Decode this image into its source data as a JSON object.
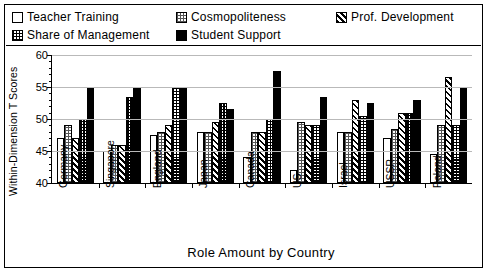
{
  "chart_data": {
    "type": "bar",
    "title": "",
    "xlabel": "Role Amount by Country",
    "ylabel": "Within-Dimension T Scores",
    "ylim": [
      40,
      60
    ],
    "yticks": [
      40,
      45,
      50,
      55,
      60
    ],
    "ytick_labels": [
      "40",
      "45",
      "50",
      "55",
      "60"
    ],
    "grid": true,
    "legend_position": "top",
    "categories": [
      "Germany",
      "Singapore",
      "England",
      "Japan",
      "Canada",
      "US",
      "Israel",
      "USSR",
      "Poland"
    ],
    "series": [
      {
        "name": "Teacher Training",
        "pattern": "white",
        "values": [
          47.0,
          45.0,
          47.5,
          48.0,
          44.0,
          42.0,
          48.0,
          47.0,
          44.5
        ]
      },
      {
        "name": "Cosmopoliteness",
        "pattern": "dots",
        "values": [
          49.0,
          46.0,
          48.0,
          48.0,
          48.0,
          49.5,
          48.0,
          48.5,
          49.0
        ]
      },
      {
        "name": "Prof. Development",
        "pattern": "hatch",
        "values": [
          47.0,
          46.0,
          49.0,
          49.5,
          48.0,
          49.0,
          53.0,
          51.0,
          56.5
        ]
      },
      {
        "name": "Share of Management",
        "pattern": "check",
        "values": [
          50.0,
          53.5,
          55.0,
          52.5,
          50.0,
          49.0,
          50.5,
          51.0,
          49.0
        ]
      },
      {
        "name": "Student Support",
        "pattern": "black",
        "values": [
          55.0,
          55.0,
          55.0,
          51.5,
          57.5,
          53.5,
          52.5,
          53.0,
          55.0
        ]
      }
    ]
  },
  "legend": {
    "items": [
      {
        "label": "Teacher Training",
        "pattern": "white"
      },
      {
        "label": "Cosmopoliteness",
        "pattern": "dots"
      },
      {
        "label": "Prof. Development",
        "pattern": "hatch"
      },
      {
        "label": "Share of Management",
        "pattern": "check"
      },
      {
        "label": "Student Support",
        "pattern": "black"
      }
    ]
  },
  "colors": {
    "frame": "#000000",
    "grid": "#b9b9b9",
    "background": "#ffffff",
    "ink": "#000000"
  }
}
